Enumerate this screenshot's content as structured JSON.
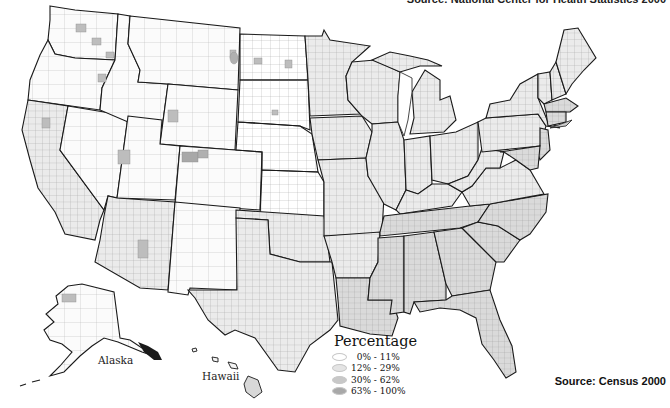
{
  "header": {
    "source_top": "Source: National Center for Health Statistics 2000"
  },
  "map": {
    "title": "",
    "labels": {
      "alaska": "Alaska",
      "hawaii": "Hawaii"
    },
    "colors": {
      "background": "#ffffff",
      "state_border": "#1a1a1a",
      "county_border": "#9a9a9a",
      "bin_0_11": "#ffffff",
      "bin_12_29": "#e4e4e4",
      "bin_30_62": "#c8c8c8",
      "bin_63_100": "#a8a8a8"
    }
  },
  "legend": {
    "title": "Percentage",
    "items": [
      {
        "label": "  0% - 11%",
        "color": "#ffffff"
      },
      {
        "label": "12% - 29%",
        "color": "#e4e4e4"
      },
      {
        "label": "30% - 62%",
        "color": "#c8c8c8"
      },
      {
        "label": "63% - 100%",
        "color": "#a8a8a8"
      }
    ]
  },
  "footer": {
    "source_bottom": "Source: Census 2000"
  }
}
